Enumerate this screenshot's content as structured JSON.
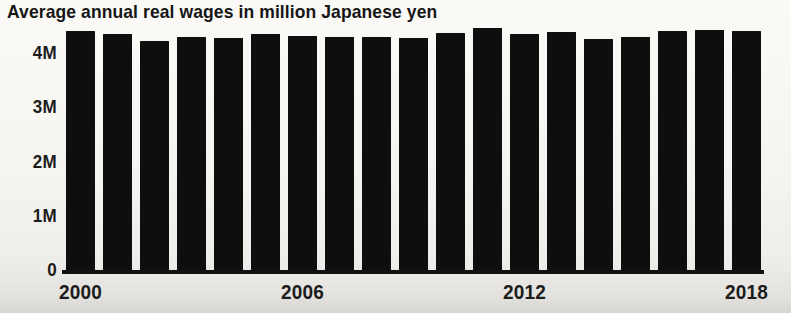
{
  "chart_data": {
    "type": "bar",
    "title": "Average annual real wages in million Japanese yen",
    "categories": [
      "2000",
      "2001",
      "2002",
      "2003",
      "2004",
      "2005",
      "2006",
      "2007",
      "2008",
      "2009",
      "2010",
      "2011",
      "2012",
      "2013",
      "2014",
      "2015",
      "2016",
      "2017",
      "2018"
    ],
    "values": [
      4.41,
      4.35,
      4.23,
      4.29,
      4.27,
      4.35,
      4.32,
      4.3,
      4.3,
      4.28,
      4.37,
      4.46,
      4.35,
      4.39,
      4.26,
      4.3,
      4.41,
      4.43,
      4.41
    ],
    "unit": "million Japanese yen",
    "xlabel": "",
    "ylabel": "",
    "ylim": [
      0,
      4.6
    ],
    "y_ticks": [
      {
        "label": "4M",
        "value": 4
      },
      {
        "label": "3M",
        "value": 3
      },
      {
        "label": "2M",
        "value": 2
      },
      {
        "label": "1M",
        "value": 1
      },
      {
        "label": "0",
        "value": 0
      }
    ],
    "x_ticks": [
      "2000",
      "2006",
      "2012",
      "2018"
    ],
    "bar_color": "#0e0e0e",
    "background_color": "#f6f4f0",
    "text_color": "#1c1c1c",
    "grid": false,
    "legend": false
  }
}
